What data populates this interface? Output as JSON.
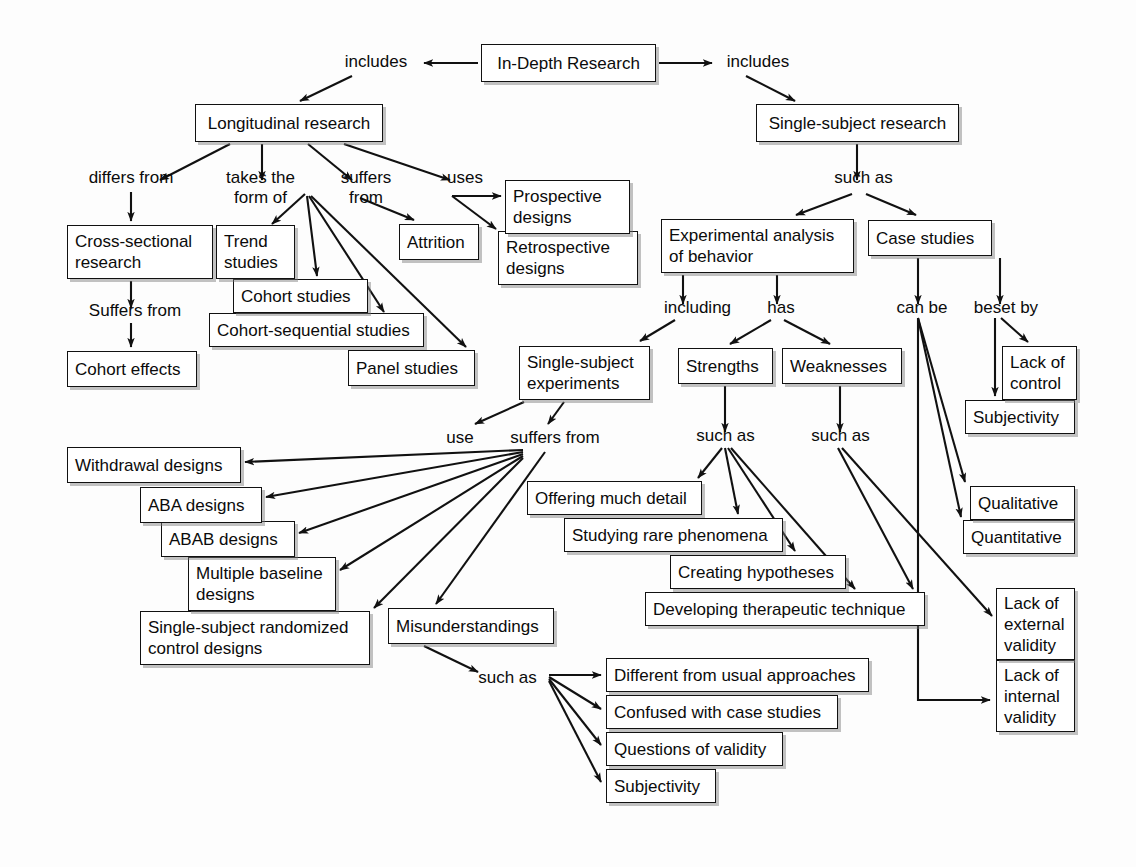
{
  "diagram": {
    "style": {
      "box_border": "#111111",
      "box_fill": "#ffffff",
      "edge_color": "#111111",
      "background": "#fdfdfd"
    },
    "nodes": [
      {
        "id": "in-depth-research",
        "text": "In-Depth Research",
        "x": 481,
        "y": 44,
        "w": 175,
        "h": 38
      },
      {
        "id": "longitudinal-research",
        "text": "Longitudinal research",
        "x": 195,
        "y": 104,
        "w": 188,
        "h": 38
      },
      {
        "id": "single-subject-research",
        "text": "Single-subject research",
        "x": 756,
        "y": 104,
        "w": 203,
        "h": 38
      },
      {
        "id": "cross-sectional-research",
        "text": "Cross-sectional\nresearch",
        "x": 67,
        "y": 225,
        "w": 146,
        "h": 54
      },
      {
        "id": "cohort-effects",
        "text": "Cohort effects",
        "x": 67,
        "y": 351,
        "w": 130,
        "h": 36
      },
      {
        "id": "trend-studies",
        "text": "Trend\nstudies",
        "x": 216,
        "y": 225,
        "w": 79,
        "h": 54
      },
      {
        "id": "cohort-studies",
        "text": "Cohort studies",
        "x": 233,
        "y": 279,
        "w": 135,
        "h": 34
      },
      {
        "id": "cohort-sequential-studies",
        "text": "Cohort-sequential studies",
        "x": 209,
        "y": 313,
        "w": 215,
        "h": 34
      },
      {
        "id": "panel-studies",
        "text": "Panel studies",
        "x": 348,
        "y": 350,
        "w": 127,
        "h": 36
      },
      {
        "id": "attrition",
        "text": "Attrition",
        "x": 399,
        "y": 224,
        "w": 80,
        "h": 36
      },
      {
        "id": "prospective-designs",
        "text": "Prospective\ndesigns",
        "x": 505,
        "y": 180,
        "w": 125,
        "h": 54
      },
      {
        "id": "retrospective-designs",
        "text": "Retrospective\ndesigns",
        "x": 498,
        "y": 231,
        "w": 140,
        "h": 54
      },
      {
        "id": "experimental-analysis-of-behavior",
        "text": "Experimental analysis\nof behavior",
        "x": 661,
        "y": 219,
        "w": 193,
        "h": 54
      },
      {
        "id": "case-studies",
        "text": "Case studies",
        "x": 868,
        "y": 220,
        "w": 124,
        "h": 36
      },
      {
        "id": "single-subject-experiments",
        "text": "Single-subject\nexperiments",
        "x": 519,
        "y": 346,
        "w": 131,
        "h": 54
      },
      {
        "id": "strengths",
        "text": "Strengths",
        "x": 678,
        "y": 348,
        "w": 95,
        "h": 36
      },
      {
        "id": "weaknesses",
        "text": "Weaknesses",
        "x": 782,
        "y": 348,
        "w": 120,
        "h": 36
      },
      {
        "id": "lack-of-control",
        "text": "Lack of\ncontrol",
        "x": 1002,
        "y": 346,
        "w": 75,
        "h": 54
      },
      {
        "id": "subjectivity-right",
        "text": "Subjectivity",
        "x": 965,
        "y": 400,
        "w": 110,
        "h": 34
      },
      {
        "id": "qualitative",
        "text": "Qualitative",
        "x": 970,
        "y": 486,
        "w": 105,
        "h": 34
      },
      {
        "id": "quantitative",
        "text": "Quantitative",
        "x": 963,
        "y": 520,
        "w": 112,
        "h": 34
      },
      {
        "id": "lack-of-external-validity",
        "text": "Lack of\nexternal\nvalidity",
        "x": 996,
        "y": 588,
        "w": 79,
        "h": 72
      },
      {
        "id": "lack-of-internal-validity",
        "text": "Lack of\ninternal\nvalidity",
        "x": 996,
        "y": 660,
        "w": 79,
        "h": 72
      },
      {
        "id": "withdrawal-designs",
        "text": "Withdrawal designs",
        "x": 67,
        "y": 447,
        "w": 174,
        "h": 36
      },
      {
        "id": "aba-designs",
        "text": "ABA designs",
        "x": 140,
        "y": 487,
        "w": 122,
        "h": 36
      },
      {
        "id": "abab-designs",
        "text": "ABAB designs",
        "x": 161,
        "y": 521,
        "w": 134,
        "h": 36
      },
      {
        "id": "multiple-baseline-designs",
        "text": "Multiple baseline\ndesigns",
        "x": 188,
        "y": 557,
        "w": 148,
        "h": 54
      },
      {
        "id": "single-subject-randomized-control-designs",
        "text": "Single-subject randomized\ncontrol designs",
        "x": 140,
        "y": 611,
        "w": 230,
        "h": 54
      },
      {
        "id": "offering-much-detail",
        "text": "Offering much detail",
        "x": 527,
        "y": 481,
        "w": 175,
        "h": 34
      },
      {
        "id": "studying-rare-phenomena",
        "text": "Studying rare phenomena",
        "x": 564,
        "y": 518,
        "w": 219,
        "h": 34
      },
      {
        "id": "creating-hypotheses",
        "text": "Creating hypotheses",
        "x": 670,
        "y": 555,
        "w": 176,
        "h": 34
      },
      {
        "id": "developing-therapeutic-technique",
        "text": "Developing therapeutic technique",
        "x": 645,
        "y": 592,
        "w": 280,
        "h": 34
      },
      {
        "id": "misunderstandings",
        "text": "Misunderstandings",
        "x": 388,
        "y": 608,
        "w": 166,
        "h": 36
      },
      {
        "id": "different-from-usual-approaches",
        "text": "Different from usual approaches",
        "x": 606,
        "y": 658,
        "w": 263,
        "h": 34
      },
      {
        "id": "confused-with-case-studies",
        "text": "Confused with case studies",
        "x": 606,
        "y": 695,
        "w": 232,
        "h": 34
      },
      {
        "id": "questions-of-validity",
        "text": "Questions of validity",
        "x": 606,
        "y": 732,
        "w": 177,
        "h": 34
      },
      {
        "id": "subjectivity-bottom",
        "text": "Subjectivity",
        "x": 606,
        "y": 769,
        "w": 110,
        "h": 34
      }
    ],
    "link_labels": [
      {
        "id": "includes-left",
        "text": "includes",
        "x": 336,
        "y": 52,
        "w": 80
      },
      {
        "id": "includes-right",
        "text": "includes",
        "x": 718,
        "y": 52,
        "w": 80
      },
      {
        "id": "differs-from",
        "text": "differs from",
        "x": 76,
        "y": 168,
        "w": 110
      },
      {
        "id": "takes-the-form-of",
        "text": "takes the\nform of",
        "x": 213,
        "y": 168,
        "w": 95
      },
      {
        "id": "suffers-from-longitudinal",
        "text": "suffers\nfrom",
        "x": 331,
        "y": 168,
        "w": 70
      },
      {
        "id": "uses",
        "text": "uses",
        "x": 440,
        "y": 168,
        "w": 50
      },
      {
        "id": "suffers-from-cross-sectional",
        "text": "Suffers from",
        "x": 75,
        "y": 301,
        "w": 120
      },
      {
        "id": "such-as-single-subject",
        "text": "such as",
        "x": 826,
        "y": 168,
        "w": 75
      },
      {
        "id": "including",
        "text": "including",
        "x": 655,
        "y": 298,
        "w": 85
      },
      {
        "id": "has",
        "text": "has",
        "x": 761,
        "y": 298,
        "w": 40
      },
      {
        "id": "can-be",
        "text": "can be",
        "x": 888,
        "y": 298,
        "w": 68
      },
      {
        "id": "beset-by",
        "text": "beset by",
        "x": 965,
        "y": 298,
        "w": 82
      },
      {
        "id": "use",
        "text": "use",
        "x": 440,
        "y": 428,
        "w": 40
      },
      {
        "id": "suffers-from-experiments",
        "text": "suffers from",
        "x": 497,
        "y": 428,
        "w": 116
      },
      {
        "id": "such-as-strengths",
        "text": "such as",
        "x": 688,
        "y": 426,
        "w": 75
      },
      {
        "id": "such-as-weaknesses",
        "text": "such as",
        "x": 803,
        "y": 426,
        "w": 75
      },
      {
        "id": "such-as-misunderstandings",
        "text": "such as",
        "x": 470,
        "y": 668,
        "w": 75
      }
    ],
    "edges": [
      {
        "from": "in-depth-research",
        "to": "includes-left",
        "label": ""
      },
      {
        "from": "includes-left",
        "to": "longitudinal-research",
        "label": ""
      },
      {
        "from": "in-depth-research",
        "to": "includes-right",
        "label": ""
      },
      {
        "from": "includes-right",
        "to": "single-subject-research",
        "label": ""
      },
      {
        "from": "longitudinal-research",
        "to": "differs-from",
        "label": ""
      },
      {
        "from": "differs-from",
        "to": "cross-sectional-research",
        "label": ""
      },
      {
        "from": "cross-sectional-research",
        "to": "suffers-from-cross-sectional",
        "label": ""
      },
      {
        "from": "suffers-from-cross-sectional",
        "to": "cohort-effects",
        "label": ""
      },
      {
        "from": "longitudinal-research",
        "to": "takes-the-form-of",
        "label": ""
      },
      {
        "from": "takes-the-form-of",
        "to": "trend-studies",
        "label": ""
      },
      {
        "from": "takes-the-form-of",
        "to": "cohort-studies",
        "label": ""
      },
      {
        "from": "takes-the-form-of",
        "to": "cohort-sequential-studies",
        "label": ""
      },
      {
        "from": "takes-the-form-of",
        "to": "panel-studies",
        "label": ""
      },
      {
        "from": "longitudinal-research",
        "to": "suffers-from-longitudinal",
        "label": ""
      },
      {
        "from": "suffers-from-longitudinal",
        "to": "attrition",
        "label": ""
      },
      {
        "from": "longitudinal-research",
        "to": "uses",
        "label": ""
      },
      {
        "from": "uses",
        "to": "prospective-designs",
        "label": ""
      },
      {
        "from": "uses",
        "to": "retrospective-designs",
        "label": ""
      },
      {
        "from": "single-subject-research",
        "to": "such-as-single-subject",
        "label": ""
      },
      {
        "from": "such-as-single-subject",
        "to": "experimental-analysis-of-behavior",
        "label": ""
      },
      {
        "from": "such-as-single-subject",
        "to": "case-studies",
        "label": ""
      },
      {
        "from": "experimental-analysis-of-behavior",
        "to": "including",
        "label": ""
      },
      {
        "from": "including",
        "to": "single-subject-experiments",
        "label": ""
      },
      {
        "from": "experimental-analysis-of-behavior",
        "to": "has",
        "label": ""
      },
      {
        "from": "has",
        "to": "strengths",
        "label": ""
      },
      {
        "from": "has",
        "to": "weaknesses",
        "label": ""
      },
      {
        "from": "case-studies",
        "to": "can-be",
        "label": ""
      },
      {
        "from": "can-be",
        "to": "qualitative",
        "label": ""
      },
      {
        "from": "can-be",
        "to": "quantitative",
        "label": ""
      },
      {
        "from": "case-studies",
        "to": "beset-by",
        "label": ""
      },
      {
        "from": "beset-by",
        "to": "lack-of-control",
        "label": ""
      },
      {
        "from": "beset-by",
        "to": "subjectivity-right",
        "label": ""
      },
      {
        "from": "single-subject-experiments",
        "to": "use",
        "label": ""
      },
      {
        "from": "use",
        "to": "withdrawal-designs",
        "label": ""
      },
      {
        "from": "use",
        "to": "aba-designs",
        "label": ""
      },
      {
        "from": "use",
        "to": "abab-designs",
        "label": ""
      },
      {
        "from": "use",
        "to": "multiple-baseline-designs",
        "label": ""
      },
      {
        "from": "use",
        "to": "single-subject-randomized-control-designs",
        "label": ""
      },
      {
        "from": "single-subject-experiments",
        "to": "suffers-from-experiments",
        "label": ""
      },
      {
        "from": "suffers-from-experiments",
        "to": "misunderstandings",
        "label": ""
      },
      {
        "from": "strengths",
        "to": "such-as-strengths",
        "label": ""
      },
      {
        "from": "such-as-strengths",
        "to": "offering-much-detail",
        "label": ""
      },
      {
        "from": "such-as-strengths",
        "to": "studying-rare-phenomena",
        "label": ""
      },
      {
        "from": "such-as-strengths",
        "to": "creating-hypotheses",
        "label": ""
      },
      {
        "from": "such-as-strengths",
        "to": "developing-therapeutic-technique",
        "label": ""
      },
      {
        "from": "weaknesses",
        "to": "such-as-weaknesses",
        "label": ""
      },
      {
        "from": "such-as-weaknesses",
        "to": "lack-of-external-validity",
        "label": ""
      },
      {
        "from": "such-as-weaknesses",
        "to": "developing-therapeutic-technique",
        "label": ""
      },
      {
        "from": "misunderstandings",
        "to": "such-as-misunderstandings",
        "label": ""
      },
      {
        "from": "such-as-misunderstandings",
        "to": "different-from-usual-approaches",
        "label": ""
      },
      {
        "from": "such-as-misunderstandings",
        "to": "confused-with-case-studies",
        "label": ""
      },
      {
        "from": "such-as-misunderstandings",
        "to": "questions-of-validity",
        "label": ""
      },
      {
        "from": "such-as-misunderstandings",
        "to": "subjectivity-bottom",
        "label": ""
      },
      {
        "from": "can-be",
        "to": "lack-of-internal-validity",
        "label": ""
      }
    ]
  }
}
